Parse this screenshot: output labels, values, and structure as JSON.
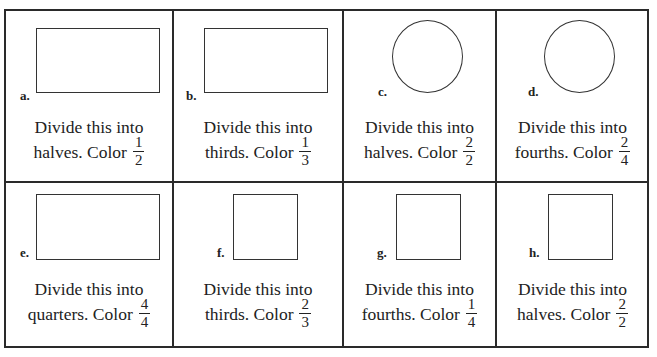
{
  "worksheet": {
    "problems": [
      {
        "label": "a.",
        "shape": "rectangle",
        "line1": "Divide this into",
        "line2": "halves. Color",
        "num": "1",
        "den": "2"
      },
      {
        "label": "b.",
        "shape": "rectangle",
        "line1": "Divide this into",
        "line2": "thirds. Color",
        "num": "1",
        "den": "3"
      },
      {
        "label": "c.",
        "shape": "circle",
        "line1": "Divide this into",
        "line2": "halves. Color",
        "num": "2",
        "den": "2"
      },
      {
        "label": "d.",
        "shape": "circle",
        "line1": "Divide this into",
        "line2": "fourths. Color",
        "num": "2",
        "den": "4"
      },
      {
        "label": "e.",
        "shape": "rectangle",
        "line1": "Divide this into",
        "line2": "quarters. Color",
        "num": "4",
        "den": "4"
      },
      {
        "label": "f.",
        "shape": "square",
        "line1": "Divide this into",
        "line2": "thirds. Color",
        "num": "2",
        "den": "3"
      },
      {
        "label": "g.",
        "shape": "square",
        "line1": "Divide this into",
        "line2": "fourths. Color",
        "num": "1",
        "den": "4"
      },
      {
        "label": "h.",
        "shape": "square",
        "line1": "Divide this into",
        "line2": "halves. Color",
        "num": "2",
        "den": "2"
      }
    ]
  }
}
